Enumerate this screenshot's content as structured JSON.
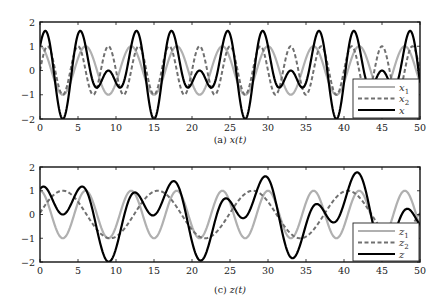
{
  "chart_data": [
    {
      "type": "line",
      "caption": "(a) x(t)",
      "caption_prefix": "(a)",
      "caption_math": "x(t)",
      "xlabel": "",
      "ylabel": "",
      "xlim": [
        0,
        50
      ],
      "ylim": [
        -2,
        2
      ],
      "xticks": [
        0,
        5,
        10,
        15,
        20,
        25,
        30,
        35,
        40,
        45,
        50
      ],
      "yticks": [
        -2,
        -1,
        0,
        1,
        2
      ],
      "ytick_labels": [
        "−2",
        "−1",
        "0",
        "1",
        "2"
      ],
      "grid": false,
      "legend_position": "lower right",
      "series": [
        {
          "name": "x1",
          "label_base": "x",
          "label_sub": "1",
          "color": "#b0b0b0",
          "style": "solid",
          "width": 2.2,
          "formula": "cos(2*pi*t/6)",
          "components": [
            {
              "amp": 1,
              "period": 6,
              "shift": 0
            }
          ]
        },
        {
          "name": "x2",
          "label_base": "x",
          "label_sub": "2",
          "color": "#707070",
          "style": "dashed",
          "width": 2.0,
          "formula": "cos(2*pi*(t-1)/4)",
          "components": [
            {
              "amp": 1,
              "period": 4,
              "shift": 1
            }
          ]
        },
        {
          "name": "x",
          "label_base": "x",
          "label_sub": "",
          "color": "#000000",
          "style": "solid",
          "width": 2.2,
          "formula": "x1 + x2",
          "components": [
            {
              "amp": 1,
              "period": 6,
              "shift": 0
            },
            {
              "amp": 1,
              "period": 4,
              "shift": 1
            }
          ]
        }
      ],
      "key_points": {
        "x_minima": [
          [
            3,
            -2
          ],
          [
            15,
            -2
          ],
          [
            27,
            -2
          ],
          [
            39,
            -2
          ]
        ],
        "x_maxima_approx": [
          [
            0.6,
            1.7
          ],
          [
            5.4,
            1.7
          ],
          [
            12.6,
            1.7
          ],
          [
            17.4,
            1.7
          ],
          [
            24.6,
            1.7
          ],
          [
            29.4,
            1.7
          ],
          [
            36.6,
            1.7
          ],
          [
            41.4,
            1.7
          ],
          [
            48.6,
            1.7
          ]
        ]
      }
    },
    {
      "type": "line",
      "caption": "(c) z(t)",
      "caption_prefix": "(c)",
      "caption_math": "z(t)",
      "xlabel": "",
      "ylabel": "",
      "xlim": [
        0,
        50
      ],
      "ylim": [
        -2,
        2
      ],
      "xticks": [
        0,
        5,
        10,
        15,
        20,
        25,
        30,
        35,
        40,
        45,
        50
      ],
      "yticks": [
        -2,
        -1,
        0,
        1,
        2
      ],
      "ytick_labels": [
        "−2",
        "−1",
        "0",
        "1",
        "2"
      ],
      "grid": false,
      "legend_position": "lower right",
      "series": [
        {
          "name": "z1",
          "label_base": "z",
          "label_sub": "1",
          "color": "#b0b0b0",
          "style": "solid",
          "width": 2.2,
          "formula": "cos(2*pi*t/6)",
          "components": [
            {
              "amp": 1,
              "period": 6,
              "shift": 0
            }
          ]
        },
        {
          "name": "z2",
          "label_base": "z",
          "label_sub": "2",
          "color": "#707070",
          "style": "dashed",
          "width": 2.0,
          "formula": "cos(2*pi*(t-3)/12.5)",
          "components": [
            {
              "amp": 1,
              "period": 12.5,
              "shift": 3
            }
          ]
        },
        {
          "name": "z",
          "label_base": "z",
          "label_sub": "",
          "color": "#000000",
          "style": "solid",
          "width": 2.2,
          "formula": "z1 + z2",
          "components": [
            {
              "amp": 1,
              "period": 6,
              "shift": 0
            },
            {
              "amp": 1,
              "period": 12.5,
              "shift": 3
            }
          ]
        }
      ],
      "key_points": {
        "z_minima_approx": [
          [
            9,
            -2.0
          ],
          [
            21,
            -1.95
          ],
          [
            33,
            -1.8
          ]
        ],
        "z_maxima_approx": [
          [
            0,
            1.1
          ],
          [
            5.5,
            1.3
          ],
          [
            12.5,
            0.85
          ],
          [
            17.5,
            1.55
          ],
          [
            29.5,
            1.65
          ],
          [
            41.7,
            1.85
          ],
          [
            48,
            0.45
          ]
        ]
      }
    }
  ],
  "layout": {
    "plots": [
      {
        "left": 40,
        "top": 22,
        "right": 420,
        "bottom": 119,
        "caption_y": 143,
        "legend": {
          "x": 353,
          "y": 79,
          "w": 66,
          "h": 39
        }
      },
      {
        "left": 40,
        "top": 167,
        "right": 420,
        "bottom": 262,
        "caption_y": 293,
        "legend": {
          "x": 353,
          "y": 223,
          "w": 66,
          "h": 38
        }
      }
    ]
  }
}
